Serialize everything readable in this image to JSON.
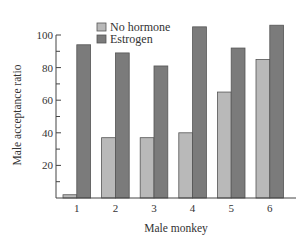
{
  "chart_data": {
    "type": "bar",
    "title": "",
    "xlabel": "Male monkey",
    "ylabel": "Male acceptance ratio",
    "categories": [
      "1",
      "2",
      "3",
      "4",
      "5",
      "6"
    ],
    "series": [
      {
        "name": "No hormone",
        "color": "#b9b9b9",
        "values": [
          2,
          37,
          37,
          40,
          65,
          85
        ]
      },
      {
        "name": "Estrogen",
        "color": "#7b7b7b",
        "values": [
          94,
          89,
          81,
          105,
          92,
          106
        ]
      }
    ],
    "ylim": [
      0,
      100
    ],
    "yticks": [
      20,
      40,
      60,
      80,
      100
    ],
    "yminor_ticks": [
      10,
      30,
      50,
      70,
      90
    ],
    "grid": false,
    "legend_position": "top-left-inside"
  }
}
